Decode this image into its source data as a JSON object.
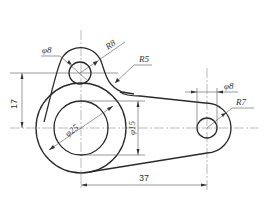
{
  "drawing": {
    "title": "Mechanical part drawing",
    "dimensions": {
      "top_hole_diameter": "φ8",
      "top_arc_radius": "R8",
      "fillet_radius": "R5",
      "right_hole_diameter": "φ8",
      "right_arc_radius": "R7",
      "vertical_offset": "17",
      "big_circle_diameter": "φ25",
      "inner_circle_diameter": "φ15",
      "horizontal_distance": "37"
    },
    "colors": {
      "outline": "#2a2a2a",
      "dimension": "#555555",
      "background": "#ffffff"
    }
  }
}
